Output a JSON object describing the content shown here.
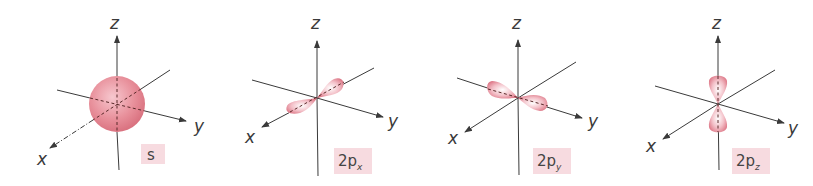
{
  "figure": {
    "orbital_color": "#e88a96",
    "tag_bg_color": "#f7dbe0",
    "panels": [
      {
        "id": "s",
        "label": "s",
        "label_sub": "",
        "axes": {
          "x": "x",
          "y": "y",
          "z": "z"
        },
        "shape": "sphere"
      },
      {
        "id": "2px",
        "label": "2p",
        "label_sub": "x",
        "axes": {
          "x": "x",
          "y": "y",
          "z": "z"
        },
        "shape": "dumbbell-along-x"
      },
      {
        "id": "2py",
        "label": "2p",
        "label_sub": "y",
        "axes": {
          "x": "x",
          "y": "y",
          "z": "z"
        },
        "shape": "dumbbell-along-y"
      },
      {
        "id": "2pz",
        "label": "2p",
        "label_sub": "z",
        "axes": {
          "x": "x",
          "y": "y",
          "z": "z"
        },
        "shape": "dumbbell-along-z"
      }
    ]
  }
}
